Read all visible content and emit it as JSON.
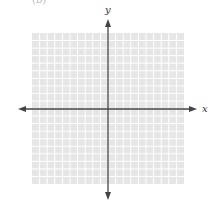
{
  "figure": {
    "corner_label": "(b)",
    "x_axis_label": "x",
    "y_axis_label": "y",
    "grid": {
      "cells_x": 20,
      "cells_y": 20,
      "left": 32,
      "top": 33,
      "width": 152,
      "height": 151,
      "fill_color": "#e6e6e6",
      "line_color": "#ffffff"
    },
    "axes": {
      "origin_x": 108,
      "origin_y": 109,
      "x_min_px": 18,
      "x_max_px": 197,
      "y_min_px": 19,
      "y_max_px": 200,
      "color": "#444444"
    }
  }
}
